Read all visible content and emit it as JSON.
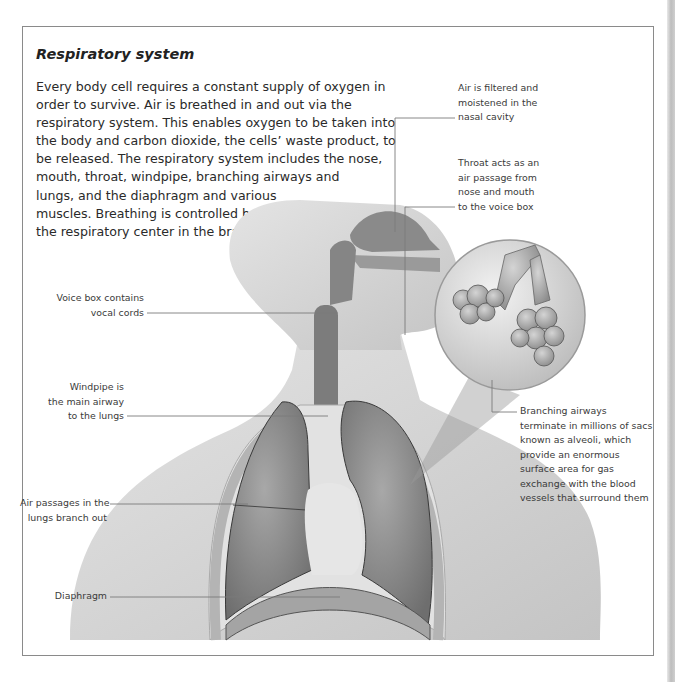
{
  "title": "Respiratory system",
  "intro_lines": [
    "Every body cell requires a constant supply of oxygen in",
    "order to survive. Air is breathed in and out via the",
    "respiratory system. This enables oxygen to be taken into",
    "the body and carbon dioxide, the cells’ waste product, to",
    "be released. The respiratory system includes the nose,",
    "mouth, throat, windpipe, branching airways and",
    "lungs, and the diaphragm and various",
    "muscles. Breathing is controlled by",
    "the respiratory center in the brain."
  ],
  "labels": {
    "nasal_cavity": [
      "Air is filtered and",
      "moistened in the",
      "nasal cavity"
    ],
    "throat": [
      "Throat acts as an",
      "air passage from",
      "nose and mouth",
      "to the voice box"
    ],
    "voice_box": [
      "Voice box contains",
      "vocal cords"
    ],
    "windpipe": [
      "Windpipe is",
      "the main airway",
      "to the lungs"
    ],
    "alveoli": [
      "Branching airways",
      "terminate in millions of sacs",
      "known as alveoli, which",
      "provide an enormous",
      "surface area for gas",
      "exchange with the blood",
      "vessels that surround them"
    ],
    "air_passages": [
      "Air passages in the",
      "lungs branch out"
    ],
    "diaphragm": [
      "Diaphragm"
    ]
  },
  "colors": {
    "frame": "#8a8a8a",
    "text": "#2a2a2a",
    "leader": "#7a7a7a",
    "body_fill": "#d6d6d6",
    "lung_fill": "#8f8f8f"
  }
}
